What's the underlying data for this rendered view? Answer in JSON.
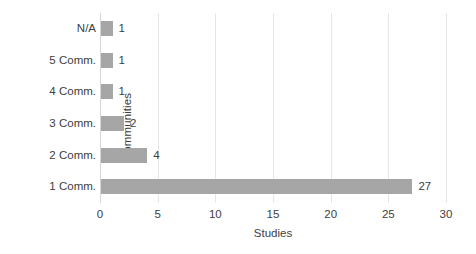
{
  "chart_data": {
    "type": "bar",
    "orientation": "horizontal",
    "title": "",
    "xlabel": "Studies",
    "ylabel": "Communities",
    "categories": [
      "1 Comm.",
      "2 Comm.",
      "3 Comm.",
      "4 Comm.",
      "5 Comm.",
      "N/A"
    ],
    "values": [
      27,
      4,
      2,
      1,
      1,
      1
    ],
    "data_labels": [
      "27",
      "4",
      "2",
      "1",
      "1",
      "1"
    ],
    "xlim": [
      0,
      30
    ],
    "xticks": [
      0,
      5,
      10,
      15,
      20,
      25,
      30
    ],
    "xtick_labels": [
      "0",
      "5",
      "10",
      "15",
      "20",
      "25",
      "30"
    ],
    "grid": "vertical",
    "legend": "none",
    "bar_color": "#a6a6a6",
    "gridline_color": "#e6e6e6",
    "axis_color": "#d6d6d6",
    "text_color": "#404040",
    "background": "#ffffff"
  },
  "axes": {
    "y_title": "Communities",
    "x_title": "Studies"
  }
}
